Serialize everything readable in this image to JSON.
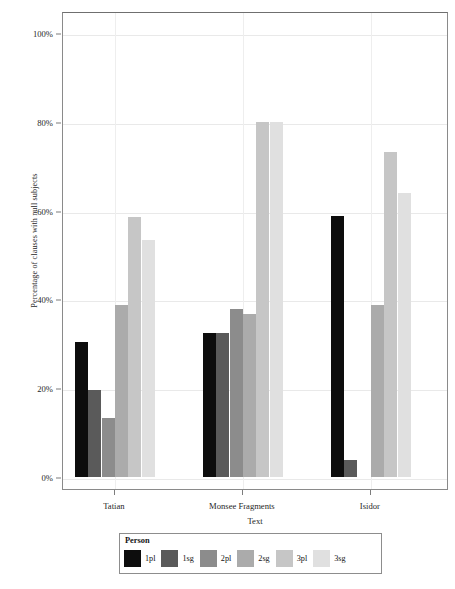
{
  "chart_data": {
    "type": "bar",
    "title": "",
    "xlabel": "Text",
    "ylabel": "Percentage of clauses with null subjects",
    "categories": [
      "Tatian",
      "Monsee Fragments",
      "Isidor"
    ],
    "legend_title": "Person",
    "legend_position": "bottom",
    "grid": true,
    "ylim": [
      0,
      105
    ],
    "yticks": [
      0,
      20,
      40,
      60,
      80,
      100
    ],
    "ytick_labels": [
      "0%",
      "20%",
      "40%",
      "60%",
      "80%",
      "100%"
    ],
    "series": [
      {
        "name": "1pl",
        "color": "#0d0d0d",
        "values": [
          30.4,
          32.5,
          58.8
        ]
      },
      {
        "name": "1sg",
        "color": "#5a5a5a",
        "values": [
          19.6,
          32.4,
          3.9
        ]
      },
      {
        "name": "2pl",
        "color": "#8c8c8c",
        "values": [
          13.2,
          37.8,
          0
        ]
      },
      {
        "name": "2sg",
        "color": "#ababab",
        "values": [
          38.7,
          36.7,
          38.7
        ]
      },
      {
        "name": "3pl",
        "color": "#c6c6c6",
        "values": [
          58.6,
          80.0,
          73.2
        ]
      },
      {
        "name": "3sg",
        "color": "#e0e0e0",
        "values": [
          53.3,
          80.0,
          64.0
        ]
      }
    ]
  }
}
